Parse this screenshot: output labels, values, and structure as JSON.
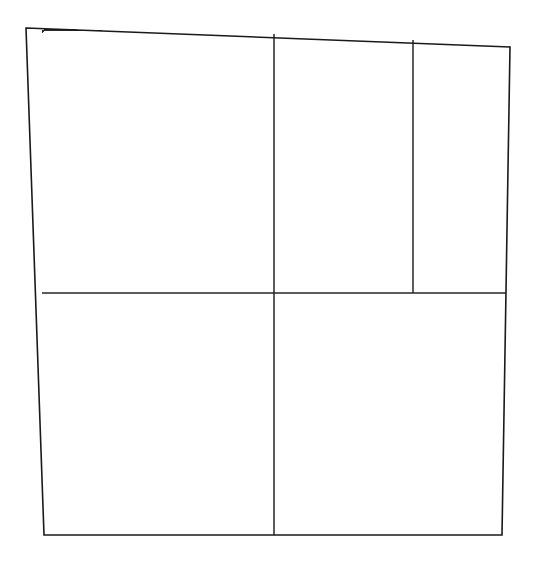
{
  "figure": {
    "kind": "contour-plot",
    "background_color": "#ffffff",
    "line_color": "#2b2b2b",
    "frame_color": "#1a1a1a",
    "title": "",
    "caption": ""
  },
  "chart_data": {
    "type": "line",
    "title": "",
    "subtitle": "",
    "xlabel": "",
    "ylabel": "",
    "grid": true,
    "legend": false,
    "legend_position": "none",
    "annotations": [],
    "xlim": [
      0,
      1
    ],
    "ylim": [
      0,
      1
    ],
    "xtick_labels": [],
    "ytick_labels": [],
    "frame": {
      "top_left": [
        26,
        28
      ],
      "top_right": [
        510,
        47
      ],
      "bottom_right": [
        502,
        535
      ],
      "bottom_left": [
        44,
        535
      ]
    },
    "gridlines": {
      "horizontal": [
        {
          "name": "mid-horizontal",
          "y": 293,
          "x_start": 42,
          "x_end": 506
        }
      ],
      "vertical": [
        {
          "name": "mid-vertical",
          "x": 274,
          "y_start": 34,
          "y_end": 535
        },
        {
          "name": "upper-right-vertical",
          "x": 413,
          "y_start": 40,
          "y_end": 293
        }
      ]
    },
    "axis_asymptotes": {
      "x_asymptote": 42,
      "y_asymptote": 30
    },
    "series": [
      {
        "name": "c1",
        "left_edge_y": 435,
        "top_edge_x": null,
        "exit": [
          345,
          390
        ]
      },
      {
        "name": "c2",
        "left_edge_y": 395,
        "top_edge_x": null,
        "exit": [
          460,
          293
        ]
      },
      {
        "name": "c3",
        "left_edge_y": 365,
        "top_edge_x": null,
        "exit": [
          408,
          293
        ]
      },
      {
        "name": "c4",
        "left_edge_y": 345,
        "top_edge_x": 500,
        "exit": [
          372,
          293
        ]
      },
      {
        "name": "c5",
        "left_edge_y": 327,
        "top_edge_x": 430,
        "exit": [
          344,
          293
        ]
      },
      {
        "name": "c6",
        "left_edge_y": 313,
        "top_edge_x": 380,
        "exit": [
          322,
          293
        ]
      },
      {
        "name": "c7",
        "left_edge_y": 302,
        "top_edge_x": 342,
        "exit": [
          304,
          293
        ]
      },
      {
        "name": "c8",
        "left_edge_y": 294,
        "top_edge_x": 312,
        "exit": [
          290,
          293
        ]
      },
      {
        "name": "c9",
        "left_edge_y": 287,
        "top_edge_x": 288,
        "exit": null
      },
      {
        "name": "c10",
        "left_edge_y": 280,
        "top_edge_x": 268,
        "exit": null
      },
      {
        "name": "c11",
        "left_edge_y": 273,
        "top_edge_x": 251,
        "exit": null
      },
      {
        "name": "c12",
        "left_edge_y": 266,
        "top_edge_x": 236,
        "exit": null
      },
      {
        "name": "c13",
        "left_edge_y": 259,
        "top_edge_x": 223,
        "exit": null
      },
      {
        "name": "c14",
        "left_edge_y": 252,
        "top_edge_x": 211,
        "exit": null
      },
      {
        "name": "c15",
        "left_edge_y": 245,
        "top_edge_x": 200,
        "exit": null
      },
      {
        "name": "c16",
        "left_edge_y": 238,
        "top_edge_x": 190,
        "exit": null
      },
      {
        "name": "c17",
        "left_edge_y": 231,
        "top_edge_x": 181,
        "exit": null
      },
      {
        "name": "c18",
        "left_edge_y": 224,
        "top_edge_x": 172,
        "exit": null
      },
      {
        "name": "c19",
        "left_edge_y": 217,
        "top_edge_x": 164,
        "exit": null
      },
      {
        "name": "c20",
        "left_edge_y": 210,
        "top_edge_x": 156,
        "exit": null
      },
      {
        "name": "c21",
        "left_edge_y": 203,
        "top_edge_x": 148,
        "exit": null
      },
      {
        "name": "c22",
        "left_edge_y": 196,
        "top_edge_x": 141,
        "exit": null
      },
      {
        "name": "c23",
        "left_edge_y": 189,
        "top_edge_x": 134,
        "exit": null
      },
      {
        "name": "c24",
        "left_edge_y": 182,
        "top_edge_x": 127,
        "exit": null
      },
      {
        "name": "c25",
        "left_edge_y": 175,
        "top_edge_x": 120,
        "exit": null
      },
      {
        "name": "c26",
        "left_edge_y": 168,
        "top_edge_x": 114,
        "exit": null
      },
      {
        "name": "c27",
        "left_edge_y": 161,
        "top_edge_x": 108,
        "exit": null
      },
      {
        "name": "c28",
        "left_edge_y": 154,
        "top_edge_x": 102,
        "exit": null
      },
      {
        "name": "c29",
        "left_edge_y": 147,
        "top_edge_x": 96,
        "exit": null
      },
      {
        "name": "c30",
        "left_edge_y": 140,
        "top_edge_x": 90,
        "exit": null
      },
      {
        "name": "c31",
        "left_edge_y": 133,
        "top_edge_x": 85,
        "exit": null
      },
      {
        "name": "c32",
        "left_edge_y": 126,
        "top_edge_x": 80,
        "exit": null
      },
      {
        "name": "c33",
        "left_edge_y": 119,
        "top_edge_x": 75,
        "exit": null
      },
      {
        "name": "c34",
        "left_edge_y": 112,
        "top_edge_x": 70,
        "exit": null
      },
      {
        "name": "c35",
        "left_edge_y": 105,
        "top_edge_x": 65,
        "exit": null
      },
      {
        "name": "c36",
        "left_edge_y": 98,
        "top_edge_x": 60,
        "exit": null
      },
      {
        "name": "c37",
        "left_edge_y": 91,
        "top_edge_x": 56,
        "exit": null
      },
      {
        "name": "c38",
        "left_edge_y": 84,
        "top_edge_x": 52,
        "exit": null
      },
      {
        "name": "c39",
        "left_edge_y": 77,
        "top_edge_x": 48,
        "exit": null
      },
      {
        "name": "c40",
        "left_edge_y": 70,
        "top_edge_x": 44,
        "exit": null
      },
      {
        "name": "c41",
        "left_edge_y": 63,
        "top_edge_x": 41,
        "exit": null
      },
      {
        "name": "c42",
        "left_edge_y": 56,
        "top_edge_x": 38,
        "exit": null
      },
      {
        "name": "c43",
        "left_edge_y": 49,
        "top_edge_x": 35,
        "exit": null
      },
      {
        "name": "c44",
        "left_edge_y": 42,
        "top_edge_x": 32,
        "exit": null
      }
    ]
  }
}
